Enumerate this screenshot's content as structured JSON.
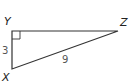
{
  "diagram": {
    "type": "right-triangle",
    "vertices": [
      {
        "name": "Y",
        "x": 12,
        "y": 31,
        "right_angle": true
      },
      {
        "name": "Z",
        "x": 118,
        "y": 31
      },
      {
        "name": "X",
        "x": 12,
        "y": 69
      }
    ],
    "labels": {
      "Y": "Y",
      "Z": "Z",
      "X": "X"
    },
    "sides": {
      "YX": "3",
      "XZ": "9"
    },
    "colors": {
      "stroke": "#333333",
      "label": "#222222",
      "measure": "#555555"
    }
  }
}
